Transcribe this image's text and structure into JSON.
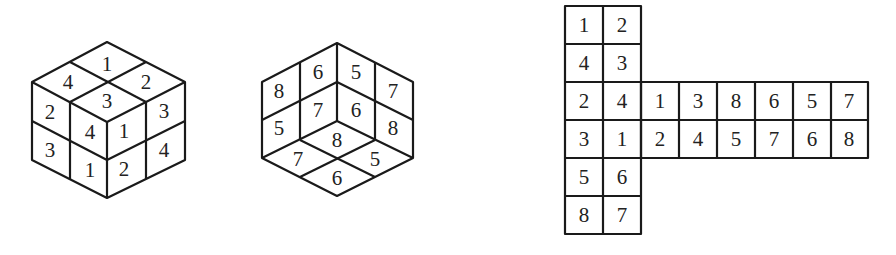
{
  "figure": {
    "cube_a": {
      "description": "2x2x2 cube, viewed from above (top, left, right faces)",
      "top_face": [
        "1",
        "4",
        "2",
        "3"
      ],
      "left_face": [
        "2",
        "4",
        "3",
        "1"
      ],
      "right_face": [
        "1",
        "3",
        "2",
        "4"
      ]
    },
    "cube_b": {
      "description": "2x2x2 cube, viewed from below (back-left, back-right, bottom faces)",
      "left_face": [
        "8",
        "6",
        "5",
        "7"
      ],
      "right_face": [
        "5",
        "7",
        "6",
        "8"
      ],
      "bottom_face": [
        "8",
        "7",
        "5",
        "6"
      ]
    },
    "net": {
      "description": "T-shaped unfolded net of the cube",
      "vertical_rows": [
        [
          "1",
          "2"
        ],
        [
          "4",
          "3"
        ],
        [
          "2",
          "4"
        ],
        [
          "3",
          "1"
        ],
        [
          "5",
          "6"
        ],
        [
          "8",
          "7"
        ]
      ],
      "horizontal_rows": [
        [
          "1",
          "3",
          "8",
          "6",
          "5",
          "7"
        ],
        [
          "2",
          "4",
          "5",
          "7",
          "6",
          "8"
        ]
      ]
    }
  }
}
